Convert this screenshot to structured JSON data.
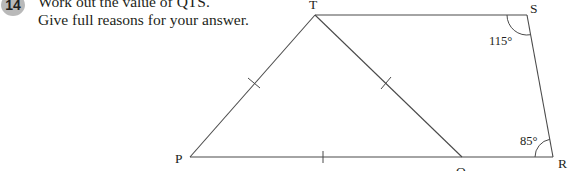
{
  "question": {
    "number": "14",
    "lines": [
      "Work out the value of QTS.",
      "Give full reasons for your answer."
    ]
  },
  "diagram": {
    "vertices": {
      "T": {
        "label": "T",
        "x": 315,
        "y": 15
      },
      "S": {
        "label": "S",
        "x": 527,
        "y": 15
      },
      "R": {
        "label": "R",
        "x": 553,
        "y": 157
      },
      "Q": {
        "label": "Q",
        "x": 462,
        "y": 157
      },
      "P": {
        "label": "P",
        "x": 190,
        "y": 157
      }
    },
    "angles": {
      "S": "115°",
      "R": "85°"
    },
    "equal_sides": [
      "PT",
      "TQ",
      "PQ"
    ]
  }
}
